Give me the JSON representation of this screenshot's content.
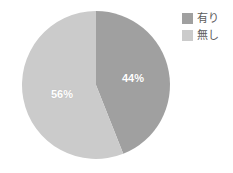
{
  "chart_data": {
    "type": "pie",
    "title": "",
    "subtitle": "",
    "xlabel": "",
    "ylabel": "",
    "grid": false,
    "legend_position": "top-right",
    "categories": [
      "有り",
      "無し"
    ],
    "values": [
      44,
      56
    ],
    "data_labels": [
      "44%",
      "56%"
    ],
    "colors": [
      "#a0a0a0",
      "#cbcbcb"
    ],
    "start_angle_deg": 0,
    "direction": "clockwise",
    "slices": [
      {
        "label": "有り",
        "value": 44,
        "data_label": "44%",
        "color": "#a0a0a0"
      },
      {
        "label": "無し",
        "value": 56,
        "data_label": "56%",
        "color": "#cbcbcb"
      }
    ]
  },
  "legend": {
    "items": [
      {
        "label": "有り",
        "color": "#a0a0a0"
      },
      {
        "label": "無し",
        "color": "#cbcbcb"
      }
    ]
  },
  "style": {
    "background": "#ffffff",
    "label_text_color": "#ffffff",
    "legend_text_color": "#5b5b5b"
  }
}
